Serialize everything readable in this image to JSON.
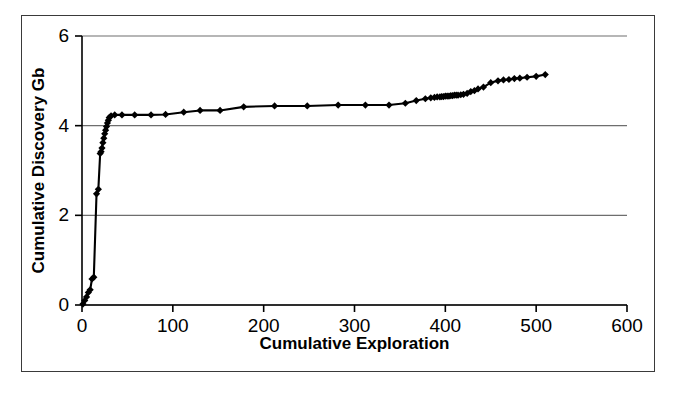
{
  "chart_data": {
    "type": "line",
    "title": "",
    "xlabel": "Cumulative Exploration",
    "ylabel": "Cumulative Discovery Gb",
    "xlim": [
      0,
      600
    ],
    "ylim": [
      0,
      6
    ],
    "xticks": [
      0,
      100,
      200,
      300,
      400,
      500,
      600
    ],
    "yticks": [
      0,
      2,
      4,
      6
    ],
    "grid": "horizontal",
    "legend": "none",
    "marker": "filled-diamond",
    "line_color": "#000000",
    "marker_color": "#000000",
    "grid_color": "#6e6e6e",
    "background_color": "#ffffff",
    "series": [
      {
        "name": "Cumulative Discovery",
        "x": [
          1,
          3,
          5,
          7,
          9,
          11,
          13,
          16,
          18,
          20,
          21,
          22,
          23,
          24,
          25,
          26,
          27,
          28,
          29,
          30,
          32,
          36,
          44,
          58,
          76,
          92,
          112,
          130,
          152,
          178,
          212,
          248,
          282,
          312,
          338,
          356,
          368,
          378,
          384,
          388,
          391,
          394,
          396,
          398,
          400,
          402,
          404,
          406,
          408,
          410,
          412,
          414,
          417,
          420,
          424,
          428,
          432,
          436,
          442,
          450,
          458,
          464,
          470,
          476,
          482,
          490,
          500,
          510
        ],
        "y": [
          0.02,
          0.1,
          0.18,
          0.28,
          0.34,
          0.58,
          0.62,
          2.48,
          2.58,
          3.38,
          3.42,
          3.5,
          3.62,
          3.72,
          3.82,
          3.9,
          3.98,
          4.06,
          4.12,
          4.18,
          4.22,
          4.24,
          4.24,
          4.24,
          4.24,
          4.25,
          4.3,
          4.34,
          4.34,
          4.42,
          4.44,
          4.44,
          4.46,
          4.46,
          4.46,
          4.5,
          4.56,
          4.6,
          4.62,
          4.63,
          4.64,
          4.64,
          4.65,
          4.65,
          4.66,
          4.66,
          4.66,
          4.67,
          4.67,
          4.68,
          4.68,
          4.68,
          4.69,
          4.7,
          4.72,
          4.76,
          4.78,
          4.82,
          4.86,
          4.96,
          5.0,
          5.02,
          5.03,
          5.05,
          5.06,
          5.08,
          5.1,
          5.14
        ]
      }
    ]
  },
  "axes": {
    "x_title": "Cumulative Exploration",
    "y_title": "Cumulative Discovery Gb",
    "x_tick_labels": [
      "0",
      "100",
      "200",
      "300",
      "400",
      "500",
      "600"
    ],
    "y_tick_labels": [
      "0",
      "2",
      "4",
      "6"
    ]
  }
}
